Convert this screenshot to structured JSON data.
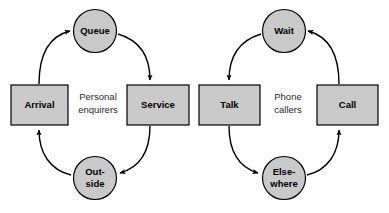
{
  "diagram": {
    "colors": {
      "node_fill": "#c9c9c9",
      "node_stroke": "#000000",
      "edge_stroke": "#000000",
      "background": "#ffffff"
    },
    "groups": [
      {
        "id": "personal",
        "label_line1": "Personal",
        "label_line2": "enquirers",
        "direction": "clockwise"
      },
      {
        "id": "phone",
        "label_line1": "Phone",
        "label_line2": "callers",
        "direction": "counter-clockwise"
      }
    ],
    "nodes": [
      {
        "id": "arrival",
        "label": "Arrival",
        "label_line1": "Arrival",
        "label_line2": "",
        "shape": "rect",
        "group": "personal"
      },
      {
        "id": "queue",
        "label": "Queue",
        "label_line1": "Queue",
        "label_line2": "",
        "shape": "circle",
        "group": "personal"
      },
      {
        "id": "service",
        "label": "Service",
        "label_line1": "Service",
        "label_line2": "",
        "shape": "rect",
        "group": "personal"
      },
      {
        "id": "outside",
        "label": "Outside",
        "label_line1": "Out-",
        "label_line2": "side",
        "shape": "circle",
        "group": "personal"
      },
      {
        "id": "talk",
        "label": "Talk",
        "label_line1": "Talk",
        "label_line2": "",
        "shape": "rect",
        "group": "phone"
      },
      {
        "id": "wait",
        "label": "Wait",
        "label_line1": "Wait",
        "label_line2": "",
        "shape": "circle",
        "group": "phone"
      },
      {
        "id": "call",
        "label": "Call",
        "label_line1": "Call",
        "label_line2": "",
        "shape": "rect",
        "group": "phone"
      },
      {
        "id": "elsewhere",
        "label": "Elsewhere",
        "label_line1": "Else-",
        "label_line2": "where",
        "shape": "circle",
        "group": "phone"
      }
    ],
    "edges": [
      {
        "from": "arrival",
        "to": "queue",
        "group": "personal"
      },
      {
        "from": "queue",
        "to": "service",
        "group": "personal"
      },
      {
        "from": "service",
        "to": "outside",
        "group": "personal"
      },
      {
        "from": "outside",
        "to": "arrival",
        "group": "personal"
      },
      {
        "from": "wait",
        "to": "talk",
        "group": "phone"
      },
      {
        "from": "talk",
        "to": "elsewhere",
        "group": "phone"
      },
      {
        "from": "elsewhere",
        "to": "call",
        "group": "phone"
      },
      {
        "from": "call",
        "to": "wait",
        "group": "phone"
      }
    ]
  }
}
